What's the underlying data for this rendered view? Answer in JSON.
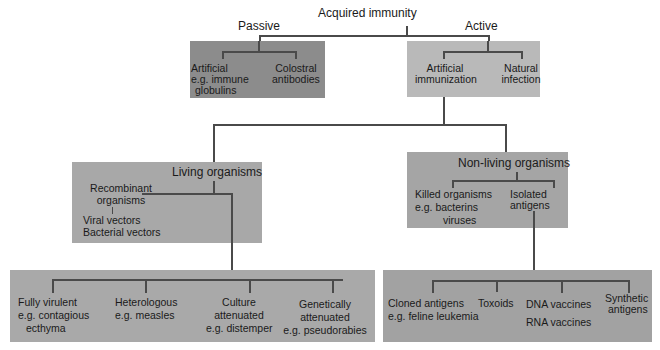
{
  "title": "Acquired immunity",
  "branches": {
    "passive": {
      "label": "Passive",
      "color": "#8c8c8c",
      "children": [
        {
          "lines": [
            "Artificial",
            "e.g. immune",
            "globulins"
          ]
        },
        {
          "lines": [
            "Colostral",
            "antibodies"
          ]
        }
      ]
    },
    "active": {
      "label": "Active",
      "color": "#b9b9b9",
      "children": [
        {
          "lines": [
            "Artificial",
            "immunization"
          ]
        },
        {
          "lines": [
            "Natural",
            "infection"
          ]
        }
      ]
    }
  },
  "living": {
    "label": "Living organisms",
    "color": "#a8a8a8",
    "recombinant": {
      "lines": [
        "Recombinant",
        "organisms"
      ],
      "sub": [
        "Viral vectors",
        "Bacterial vectors"
      ]
    },
    "types": {
      "color": "#a9a9a9",
      "items": [
        {
          "lines": [
            "Fully virulent",
            "e.g. contagious",
            "ecthyma"
          ]
        },
        {
          "lines": [
            "Heterologous",
            "e.g. measles"
          ]
        },
        {
          "lines": [
            "Culture",
            "attenuated",
            "e.g. distemper"
          ]
        },
        {
          "lines": [
            "Genetically",
            "attenuated",
            "e.g. pseudorabies"
          ]
        }
      ]
    }
  },
  "nonliving": {
    "label": "Non-living organisms",
    "color": "#a5a5a5",
    "killed": {
      "lines": [
        "Killed organisms",
        "e.g. bacterins",
        "viruses"
      ]
    },
    "isolated": {
      "lines": [
        "Isolated",
        "antigens"
      ]
    },
    "types": {
      "color": "#a2a2a2",
      "items": [
        {
          "lines": [
            "Cloned antigens",
            "e.g. feline leukemia"
          ]
        },
        {
          "lines": [
            "Toxoids"
          ]
        },
        {
          "lines": [
            "DNA vaccines",
            "RNA vaccines"
          ]
        },
        {
          "lines": [
            "Synthetic",
            "antigens"
          ]
        }
      ]
    }
  }
}
